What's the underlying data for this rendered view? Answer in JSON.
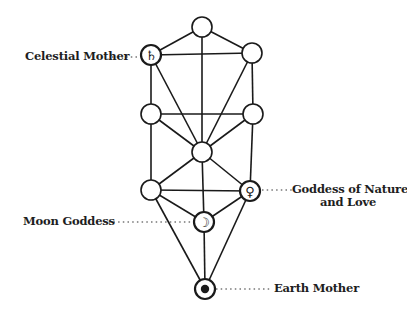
{
  "diagram": {
    "type": "tree-of-life",
    "line_color": "#1a1a1a",
    "background": "#ffffff",
    "nodes": [
      {
        "id": "n1",
        "x": 202,
        "y": 27,
        "r": 10,
        "symbol": ""
      },
      {
        "id": "n2",
        "x": 252,
        "y": 53,
        "r": 10,
        "symbol": ""
      },
      {
        "id": "n3",
        "x": 151,
        "y": 55,
        "r": 10,
        "symbol": "saturn"
      },
      {
        "id": "n4",
        "x": 253,
        "y": 114,
        "r": 10,
        "symbol": ""
      },
      {
        "id": "n5",
        "x": 151,
        "y": 114,
        "r": 10,
        "symbol": ""
      },
      {
        "id": "n6",
        "x": 202,
        "y": 152,
        "r": 10,
        "symbol": ""
      },
      {
        "id": "n7",
        "x": 250,
        "y": 191,
        "r": 10,
        "symbol": "venus"
      },
      {
        "id": "n8",
        "x": 151,
        "y": 190,
        "r": 10,
        "symbol": ""
      },
      {
        "id": "n9",
        "x": 204,
        "y": 222,
        "r": 10,
        "symbol": "moon"
      },
      {
        "id": "n10",
        "x": 205,
        "y": 289,
        "r": 10,
        "symbol": "earth"
      }
    ],
    "edges": [
      [
        "n1",
        "n2"
      ],
      [
        "n1",
        "n3"
      ],
      [
        "n1",
        "n6"
      ],
      [
        "n2",
        "n3"
      ],
      [
        "n2",
        "n4"
      ],
      [
        "n2",
        "n6"
      ],
      [
        "n3",
        "n5"
      ],
      [
        "n3",
        "n6"
      ],
      [
        "n4",
        "n5"
      ],
      [
        "n4",
        "n6"
      ],
      [
        "n4",
        "n7"
      ],
      [
        "n5",
        "n6"
      ],
      [
        "n5",
        "n8"
      ],
      [
        "n6",
        "n7"
      ],
      [
        "n6",
        "n8"
      ],
      [
        "n6",
        "n9"
      ],
      [
        "n7",
        "n8"
      ],
      [
        "n7",
        "n9"
      ],
      [
        "n7",
        "n10"
      ],
      [
        "n8",
        "n9"
      ],
      [
        "n8",
        "n10"
      ],
      [
        "n9",
        "n10"
      ]
    ],
    "labels": {
      "celestial_mother": "Celestial Mother",
      "goddess_nature_line1": "Goddess of Nature",
      "goddess_nature_line2": "and Love",
      "moon_goddess": "Moon Goddess",
      "earth_mother": "Earth Mother"
    },
    "symbols": {
      "saturn": "♄",
      "venus": "♀",
      "moon": "☽",
      "earth": "●"
    }
  }
}
